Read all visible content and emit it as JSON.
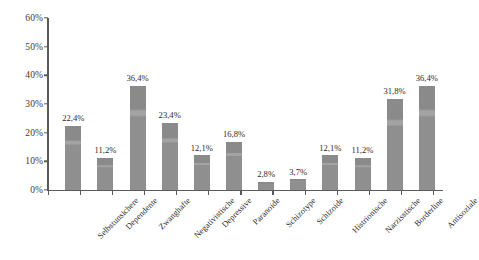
{
  "chart_data": {
    "type": "bar",
    "title": "",
    "subtitle": "",
    "xlabel": "",
    "ylabel": "",
    "ylim": [
      0,
      60
    ],
    "y_tick_step": 10,
    "grid": false,
    "legend": false,
    "legend_position": "none",
    "value_suffix": "%",
    "decimal_separator": ",",
    "bar_color": "#8c8c8c",
    "axis_color": "#5a5a5a",
    "background_color": "#ffffff",
    "text_color": "#2b2b2b",
    "categories": [
      "Selbstunsichere",
      "Dependente",
      "Zwanghafte",
      "Negativistische",
      "Depressive",
      "Paranoide",
      "Schizotype",
      "Schizoide",
      "Histrionische",
      "Narzisstische",
      "Borderline",
      "Antisoziale"
    ],
    "values": [
      22.4,
      11.2,
      36.4,
      23.4,
      12.1,
      16.8,
      2.8,
      3.7,
      12.1,
      11.2,
      31.8,
      36.4
    ],
    "value_labels": [
      "22,4%",
      "11,2%",
      "36,4%",
      "23,4%",
      "12,1%",
      "16,8%",
      "2,8%",
      "3,7%",
      "12,1%",
      "11,2%",
      "31,8%",
      "36,4%"
    ],
    "y_tick_labels": [
      "0%",
      "10%",
      "20%",
      "30%",
      "40%",
      "50%",
      "60%"
    ],
    "y_tick_values": [
      0,
      10,
      20,
      30,
      40,
      50,
      60
    ]
  }
}
